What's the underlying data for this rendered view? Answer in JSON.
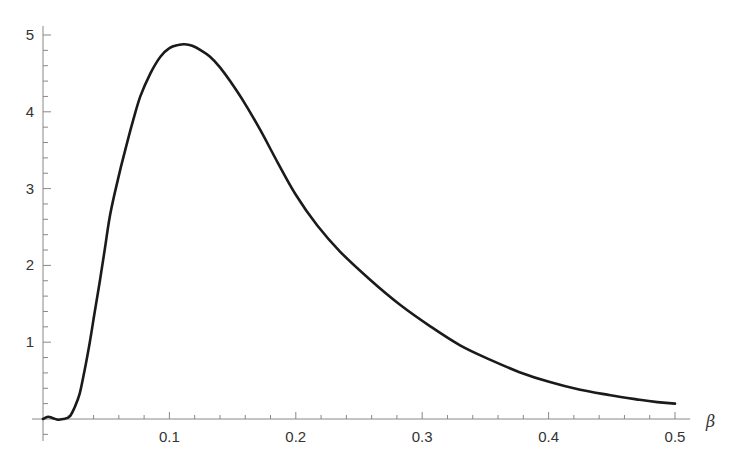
{
  "chart_data": {
    "type": "line",
    "title": "",
    "xlabel": "β",
    "ylabel": "",
    "xlim": [
      0,
      0.5
    ],
    "ylim": [
      -0.3,
      5.15
    ],
    "grid": false,
    "legend": null,
    "x_ticks": [
      "0.1",
      "0.2",
      "0.3",
      "0.4",
      "0.5"
    ],
    "x_tick_values": [
      0.1,
      0.2,
      0.3,
      0.4,
      0.5
    ],
    "y_ticks": [
      "1",
      "2",
      "3",
      "4",
      "5"
    ],
    "y_tick_values": [
      1,
      2,
      3,
      4,
      5
    ],
    "colors": {
      "line": "#1a1a1a",
      "axis": "#888888",
      "text": "#333333"
    },
    "series": [
      {
        "name": "curve",
        "x": [
          0.0,
          0.004,
          0.008,
          0.012,
          0.016,
          0.021,
          0.025,
          0.029,
          0.033,
          0.037,
          0.041,
          0.045,
          0.049,
          0.053,
          0.059,
          0.065,
          0.071,
          0.077,
          0.085,
          0.093,
          0.1,
          0.107,
          0.112,
          0.118,
          0.125,
          0.132,
          0.14,
          0.148,
          0.16,
          0.172,
          0.186,
          0.2,
          0.217,
          0.235,
          0.259,
          0.283,
          0.307,
          0.33,
          0.354,
          0.377,
          0.401,
          0.425,
          0.449,
          0.472,
          0.486,
          0.5
        ],
        "y": [
          0.0,
          0.03,
          0.01,
          -0.01,
          0.0,
          0.03,
          0.15,
          0.33,
          0.64,
          1.0,
          1.4,
          1.8,
          2.22,
          2.65,
          3.1,
          3.5,
          3.87,
          4.2,
          4.5,
          4.72,
          4.83,
          4.87,
          4.88,
          4.86,
          4.8,
          4.72,
          4.58,
          4.4,
          4.1,
          3.76,
          3.33,
          2.92,
          2.52,
          2.18,
          1.81,
          1.48,
          1.2,
          0.96,
          0.77,
          0.61,
          0.48,
          0.38,
          0.31,
          0.25,
          0.22,
          0.2
        ]
      }
    ]
  }
}
